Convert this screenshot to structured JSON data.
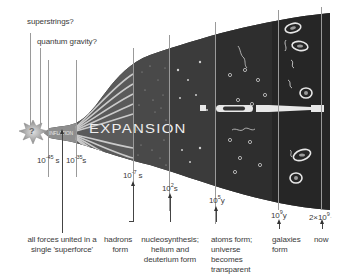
{
  "diagram": {
    "colors": {
      "background": "#ffffff",
      "universe_dark": "#2e2e2e",
      "universe_mid": "#4a4a4a",
      "inflation_grey": "#8c8c8c",
      "stripe": "#d8d8d8",
      "line": "#9a9a9a",
      "text": "#3a3a3a"
    },
    "banner": {
      "question_mark": "?",
      "inflation": "INFLATION",
      "expansion": "EXPANSION"
    },
    "top_labels": [
      {
        "id": "superstrings",
        "text": "superstrings?"
      },
      {
        "id": "quantum-gravity",
        "text": "quantum gravity?"
      }
    ],
    "time_ticks": [
      {
        "id": "t1",
        "base": "10",
        "exp": "-45",
        "unit": "s"
      },
      {
        "id": "t2",
        "base": "10",
        "exp": "-35",
        "unit": "s"
      },
      {
        "id": "t3",
        "base": "10",
        "exp": "-7",
        "unit": "s"
      },
      {
        "id": "t4",
        "base": "10",
        "exp": "2",
        "unit": "s"
      },
      {
        "id": "t5",
        "base": "10",
        "exp": "5",
        "unit": "y"
      },
      {
        "id": "t6",
        "base": "10",
        "exp": "9",
        "unit": "y"
      },
      {
        "id": "t7",
        "base": "2×10",
        "exp": "9",
        "unit": "y"
      }
    ],
    "events": [
      {
        "id": "superforce",
        "lines": [
          "all forces united in a",
          "single 'superforce'"
        ]
      },
      {
        "id": "hadrons",
        "lines": [
          "hadrons",
          "form"
        ]
      },
      {
        "id": "nucleosynthesis",
        "lines": [
          "nucleosynthesis;",
          "helium and",
          "deuterium form"
        ]
      },
      {
        "id": "atoms",
        "lines": [
          "atoms form;",
          "universe",
          "becomes",
          "transparent"
        ]
      },
      {
        "id": "galaxies",
        "lines": [
          "galaxies",
          "form"
        ]
      },
      {
        "id": "now",
        "lines": [
          "now"
        ]
      }
    ]
  }
}
